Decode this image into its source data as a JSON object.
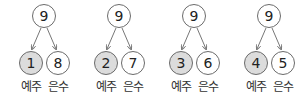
{
  "groups": [
    {
      "total": "9",
      "left": "1",
      "right": "8",
      "left_label": "예주",
      "right_label": "은수"
    },
    {
      "total": "9",
      "left": "2",
      "right": "7",
      "left_label": "예주",
      "right_label": "은수"
    },
    {
      "total": "9",
      "left": "3",
      "right": "6",
      "left_label": "예주",
      "right_label": "은수"
    },
    {
      "total": "9",
      "left": "4",
      "right": "5",
      "left_label": "예주",
      "right_label": "은수"
    }
  ],
  "colors": {
    "shaded_fill": "#dcdcdc",
    "stroke": "#6b6b6b"
  }
}
